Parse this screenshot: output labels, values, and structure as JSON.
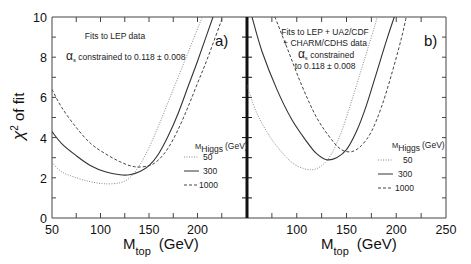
{
  "chart_data": [
    {
      "type": "line",
      "panel": "a)",
      "title": "",
      "annotations": [
        "Fits to LEP data",
        "αs constrained  to 0.118 ± 0.008"
      ],
      "xlabel": "M_top (GeV)",
      "ylabel": "χ² of fit",
      "xlim": [
        50,
        250
      ],
      "ylim": [
        0,
        10
      ],
      "xticks": [
        50,
        100,
        150,
        200
      ],
      "yticks": [
        0,
        2,
        4,
        6,
        8,
        10
      ],
      "grid": false,
      "legend_title": "M_Higgs (GeV)",
      "legend_position": "lower right",
      "series": [
        {
          "name": "50",
          "style": "dotted",
          "x": [
            50,
            60,
            75,
            90,
            105,
            120,
            130,
            140,
            150,
            160,
            170,
            180,
            190,
            205
          ],
          "y": [
            2.75,
            2.3,
            2.0,
            1.8,
            1.7,
            1.75,
            2.0,
            2.6,
            3.5,
            4.6,
            5.8,
            7.0,
            8.2,
            10
          ]
        },
        {
          "name": "300",
          "style": "solid",
          "x": [
            50,
            60,
            75,
            90,
            105,
            120,
            130,
            140,
            150,
            160,
            170,
            180,
            190,
            200,
            216
          ],
          "y": [
            4.3,
            3.7,
            3.1,
            2.6,
            2.3,
            2.15,
            2.15,
            2.3,
            2.6,
            3.2,
            4.1,
            5.2,
            6.5,
            7.8,
            10
          ]
        },
        {
          "name": "1000",
          "style": "dashed",
          "x": [
            50,
            60,
            75,
            90,
            105,
            120,
            135,
            150,
            160,
            170,
            180,
            190,
            200,
            210,
            226
          ],
          "y": [
            6.4,
            5.5,
            4.5,
            3.7,
            3.2,
            2.8,
            2.55,
            2.6,
            2.9,
            3.5,
            4.4,
            5.5,
            6.7,
            7.9,
            10
          ]
        }
      ]
    },
    {
      "type": "line",
      "panel": "b)",
      "title": "",
      "annotations": [
        "Fits to LEP + UA2/CDF",
        "+ CHARM/CDHS data",
        "αs constrained",
        "to 0.118 ± 0.008"
      ],
      "xlabel": "M_top (GeV)",
      "ylabel": "χ² of fit",
      "xlim": [
        50,
        250
      ],
      "ylim": [
        0,
        10
      ],
      "xticks": [
        100,
        150,
        200,
        250
      ],
      "yticks": [
        0,
        2,
        4,
        6,
        8,
        10
      ],
      "grid": false,
      "legend_title": "M_Higgs (GeV)",
      "legend_position": "lower right",
      "series": [
        {
          "name": "50",
          "style": "dotted",
          "x": [
            50,
            60,
            75,
            90,
            100,
            114,
            125,
            135,
            145,
            155,
            165,
            175,
            181
          ],
          "y": [
            6.6,
            5.2,
            3.9,
            3.0,
            2.6,
            2.4,
            2.6,
            3.2,
            4.3,
            5.8,
            7.4,
            9.0,
            10
          ]
        },
        {
          "name": "300",
          "style": "solid",
          "x": [
            55,
            65,
            80,
            95,
            110,
            120,
            130,
            140,
            150,
            160,
            170,
            180,
            190,
            198
          ],
          "y": [
            10,
            8.3,
            6.4,
            4.9,
            3.8,
            3.2,
            2.9,
            3.0,
            3.4,
            4.3,
            5.6,
            7.2,
            8.8,
            10
          ]
        },
        {
          "name": "1000",
          "style": "dashed",
          "x": [
            78,
            90,
            105,
            120,
            135,
            145,
            155,
            165,
            175,
            185,
            195,
            205,
            210
          ],
          "y": [
            10,
            8.5,
            6.6,
            5.0,
            3.9,
            3.4,
            3.3,
            3.6,
            4.3,
            5.5,
            7.1,
            8.9,
            10
          ]
        }
      ]
    }
  ],
  "figure": {
    "ylabel_main": "χ",
    "ylabel_sup": "2",
    "ylabel_rest": " of fit",
    "xlabel_main": "M",
    "xlabel_sub": "top",
    "xlabel_unit": "(GeV)",
    "legend_m": "M",
    "legend_sub": "Higgs",
    "legend_unit": "(GeV)",
    "panel_a_label": "a)",
    "panel_b_label": "b)",
    "panel_a_line1": "Fits to LEP data",
    "panel_a_alpha": "α",
    "panel_a_alpha_sub": "s",
    "panel_a_line2": " constrained  to 0.118 ± 0.008",
    "panel_b_line1": "Fits to LEP + UA2/CDF",
    "panel_b_line2": "+ CHARM/CDHS data",
    "panel_b_alpha": "α",
    "panel_b_alpha_sub": "s",
    "panel_b_line3": " constrained",
    "panel_b_line4": "to 0.118 ± 0.008"
  }
}
